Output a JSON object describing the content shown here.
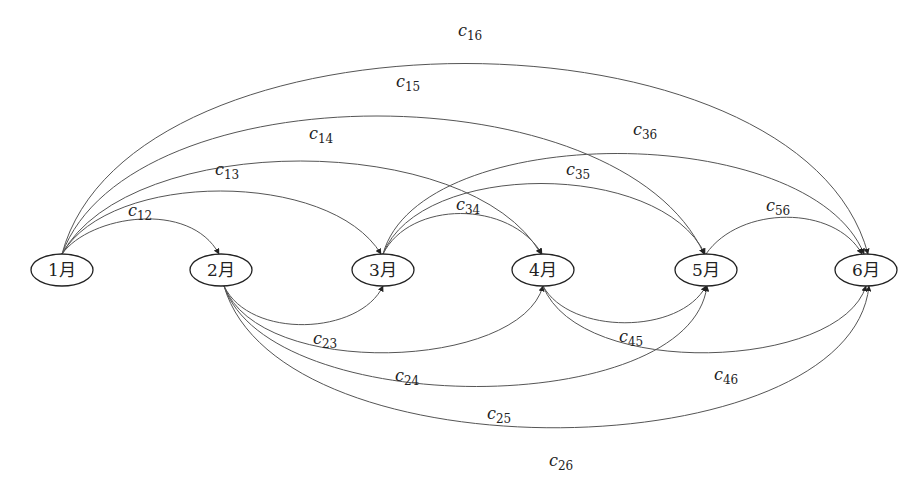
{
  "diagram": {
    "type": "directed-graph",
    "nodes": [
      {
        "id": "1",
        "label": "1月",
        "x": 62,
        "y": 270
      },
      {
        "id": "2",
        "label": "2月",
        "x": 221,
        "y": 270
      },
      {
        "id": "3",
        "label": "3月",
        "x": 383,
        "y": 270
      },
      {
        "id": "4",
        "label": "4月",
        "x": 543,
        "y": 270
      },
      {
        "id": "5",
        "label": "5月",
        "x": 706,
        "y": 270
      },
      {
        "id": "6",
        "label": "6月",
        "x": 866,
        "y": 270
      }
    ],
    "edges": [
      {
        "from": "1",
        "to": "2",
        "label": "c",
        "sub": "12",
        "side": "top"
      },
      {
        "from": "1",
        "to": "3",
        "label": "c",
        "sub": "13",
        "side": "top"
      },
      {
        "from": "1",
        "to": "4",
        "label": "c",
        "sub": "14",
        "side": "top"
      },
      {
        "from": "1",
        "to": "5",
        "label": "c",
        "sub": "15",
        "side": "top"
      },
      {
        "from": "1",
        "to": "6",
        "label": "c",
        "sub": "16",
        "side": "top"
      },
      {
        "from": "2",
        "to": "3",
        "label": "c",
        "sub": "23",
        "side": "bottom"
      },
      {
        "from": "2",
        "to": "4",
        "label": "c",
        "sub": "24",
        "side": "bottom"
      },
      {
        "from": "2",
        "to": "5",
        "label": "c",
        "sub": "25",
        "side": "bottom"
      },
      {
        "from": "2",
        "to": "6",
        "label": "c",
        "sub": "26",
        "side": "bottom"
      },
      {
        "from": "3",
        "to": "4",
        "label": "c",
        "sub": "34",
        "side": "top"
      },
      {
        "from": "3",
        "to": "5",
        "label": "c",
        "sub": "35",
        "side": "top"
      },
      {
        "from": "3",
        "to": "6",
        "label": "c",
        "sub": "36",
        "side": "top"
      },
      {
        "from": "4",
        "to": "5",
        "label": "c",
        "sub": "45",
        "side": "bottom"
      },
      {
        "from": "4",
        "to": "6",
        "label": "c",
        "sub": "46",
        "side": "bottom"
      },
      {
        "from": "5",
        "to": "6",
        "label": "c",
        "sub": "56",
        "side": "top"
      }
    ]
  }
}
